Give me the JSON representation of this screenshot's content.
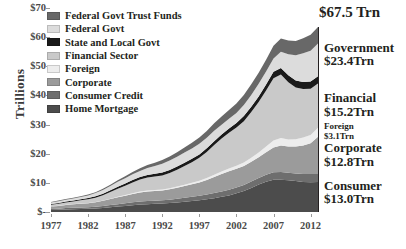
{
  "chart_data": {
    "type": "area",
    "title": "",
    "xlabel": "",
    "ylabel": "Trillions",
    "grid": false,
    "legend_position": "top-left",
    "x": [
      1977,
      1978,
      1979,
      1980,
      1981,
      1982,
      1983,
      1984,
      1985,
      1986,
      1987,
      1988,
      1989,
      1990,
      1991,
      1992,
      1993,
      1994,
      1995,
      1996,
      1997,
      1998,
      1999,
      2000,
      2001,
      2002,
      2003,
      2004,
      2005,
      2006,
      2007,
      2008,
      2009,
      2010,
      2011,
      2012,
      2013
    ],
    "xlim": [
      1977,
      2013
    ],
    "ylim": [
      0,
      70
    ],
    "yticks": [
      0,
      10,
      20,
      30,
      40,
      50,
      60,
      70
    ],
    "ytick_labels": [
      "$-",
      "$10",
      "$20",
      "$30",
      "$40",
      "$50",
      "$60",
      "$70"
    ],
    "xticks": [
      1977,
      1982,
      1987,
      1992,
      1997,
      2002,
      2007,
      2012
    ],
    "xtick_labels": [
      "1977",
      "1982",
      "1987",
      "1992",
      "1997",
      "2002",
      "2007",
      "2012"
    ],
    "total_label": "$67.5 Trn",
    "series": [
      {
        "name": "Home Mortgage",
        "color": "#4c4c4c",
        "values": [
          0.65,
          0.75,
          0.88,
          0.98,
          1.05,
          1.1,
          1.22,
          1.38,
          1.6,
          1.85,
          2.1,
          2.35,
          2.55,
          2.7,
          2.82,
          2.95,
          3.1,
          3.3,
          3.5,
          3.75,
          4.0,
          4.35,
          4.75,
          5.2,
          5.7,
          6.4,
          7.2,
          8.25,
          9.4,
          10.4,
          11.1,
          11.1,
          10.9,
          10.6,
          10.3,
          10.2,
          10.3
        ]
      },
      {
        "name": "Consumer Credit",
        "color": "#6e6e6e",
        "values": [
          0.35,
          0.4,
          0.45,
          0.46,
          0.48,
          0.5,
          0.56,
          0.66,
          0.77,
          0.85,
          0.9,
          0.96,
          1.02,
          1.05,
          1.04,
          1.05,
          1.12,
          1.25,
          1.4,
          1.5,
          1.58,
          1.65,
          1.75,
          1.85,
          1.95,
          2.02,
          2.1,
          2.2,
          2.3,
          2.42,
          2.55,
          2.6,
          2.55,
          2.65,
          2.75,
          2.85,
          2.7
        ]
      },
      {
        "name": "Corporate",
        "color": "#9b9b9b",
        "values": [
          0.85,
          0.95,
          1.08,
          1.18,
          1.3,
          1.42,
          1.55,
          1.8,
          2.05,
          2.35,
          2.6,
          2.9,
          3.15,
          3.3,
          3.35,
          3.4,
          3.55,
          3.75,
          4.0,
          4.25,
          4.55,
          5.0,
          5.5,
          6.0,
          6.3,
          6.4,
          6.5,
          6.75,
          7.1,
          7.7,
          8.5,
          9.1,
          9.0,
          9.2,
          9.8,
          10.5,
          12.8
        ]
      },
      {
        "name": "Foreign",
        "color": "#ededed",
        "values": [
          0.06,
          0.07,
          0.08,
          0.09,
          0.1,
          0.11,
          0.12,
          0.14,
          0.16,
          0.19,
          0.22,
          0.25,
          0.28,
          0.31,
          0.33,
          0.35,
          0.38,
          0.42,
          0.47,
          0.53,
          0.6,
          0.68,
          0.78,
          0.88,
          0.96,
          1.04,
          1.18,
          1.38,
          1.62,
          1.95,
          2.35,
          2.55,
          2.45,
          2.55,
          2.72,
          2.9,
          3.1
        ]
      },
      {
        "name": "Financial Sector",
        "color": "#c9c9c9",
        "values": [
          0.55,
          0.66,
          0.8,
          0.92,
          1.08,
          1.25,
          1.48,
          1.8,
          2.25,
          2.75,
          3.2,
          3.7,
          4.15,
          4.45,
          4.6,
          4.8,
          5.2,
          5.75,
          6.4,
          7.05,
          7.85,
          8.95,
          10.2,
          11.3,
          12.3,
          13.1,
          14.2,
          15.7,
          17.3,
          19.2,
          21.4,
          21.8,
          19.6,
          17.7,
          16.6,
          15.8,
          15.2
        ]
      },
      {
        "name": "State and Local Govt",
        "color": "#1a1a1a",
        "values": [
          0.26,
          0.28,
          0.3,
          0.32,
          0.35,
          0.4,
          0.45,
          0.5,
          0.6,
          0.7,
          0.75,
          0.8,
          0.85,
          0.9,
          0.96,
          1.02,
          1.08,
          1.1,
          1.12,
          1.15,
          1.18,
          1.25,
          1.32,
          1.38,
          1.45,
          1.6,
          1.75,
          1.85,
          1.95,
          2.05,
          2.2,
          2.3,
          2.4,
          2.45,
          2.48,
          2.5,
          2.5
        ]
      },
      {
        "name": "Federal Govt",
        "color": "#dcdcdc",
        "values": [
          0.55,
          0.6,
          0.62,
          0.7,
          0.78,
          0.92,
          1.1,
          1.28,
          1.48,
          1.68,
          1.82,
          1.96,
          2.1,
          2.35,
          2.65,
          2.95,
          3.2,
          3.35,
          3.5,
          3.6,
          3.65,
          3.6,
          3.55,
          3.35,
          3.3,
          3.45,
          3.75,
          4.05,
          4.3,
          4.45,
          4.6,
          5.5,
          7.2,
          8.6,
          9.8,
          10.6,
          11.2
        ]
      },
      {
        "name": "Federal Govt Trust Funds",
        "color": "#686868",
        "values": [
          0.18,
          0.2,
          0.22,
          0.24,
          0.26,
          0.28,
          0.32,
          0.38,
          0.45,
          0.55,
          0.65,
          0.78,
          0.92,
          1.05,
          1.18,
          1.3,
          1.45,
          1.6,
          1.75,
          1.92,
          2.12,
          2.35,
          2.6,
          2.85,
          3.05,
          3.25,
          3.45,
          3.65,
          3.85,
          4.1,
          4.35,
          4.55,
          4.75,
          4.95,
          5.2,
          5.45,
          5.7
        ]
      }
    ]
  },
  "legend": {
    "items": [
      {
        "label": "Federal Govt Trust Funds",
        "color": "#686868"
      },
      {
        "label": "Federal Govt",
        "color": "#dcdcdc"
      },
      {
        "label": "State and Local Govt",
        "color": "#1a1a1a"
      },
      {
        "label": "Financial Sector",
        "color": "#c9c9c9"
      },
      {
        "label": "Foreign",
        "color": "#ededed"
      },
      {
        "label": "Corporate",
        "color": "#9b9b9b"
      },
      {
        "label": "Consumer Credit",
        "color": "#6e6e6e"
      },
      {
        "label": "Home Mortgage",
        "color": "#4c4c4c"
      }
    ]
  },
  "annotations": {
    "total": "$67.5 Trn",
    "groups": [
      {
        "name": "Government",
        "value": "$23.4Trn",
        "size": "big"
      },
      {
        "name": "Financial",
        "value": "$15.2Trn",
        "size": "big"
      },
      {
        "name": "Foreign",
        "value": "$3.1Trn",
        "size": "small"
      },
      {
        "name": "Corporate",
        "value": "$12.8Trn",
        "size": "big"
      },
      {
        "name": "Consumer",
        "value": "$13.0Trn",
        "size": "big"
      }
    ]
  },
  "axis": {
    "y_title": "Trillions"
  }
}
